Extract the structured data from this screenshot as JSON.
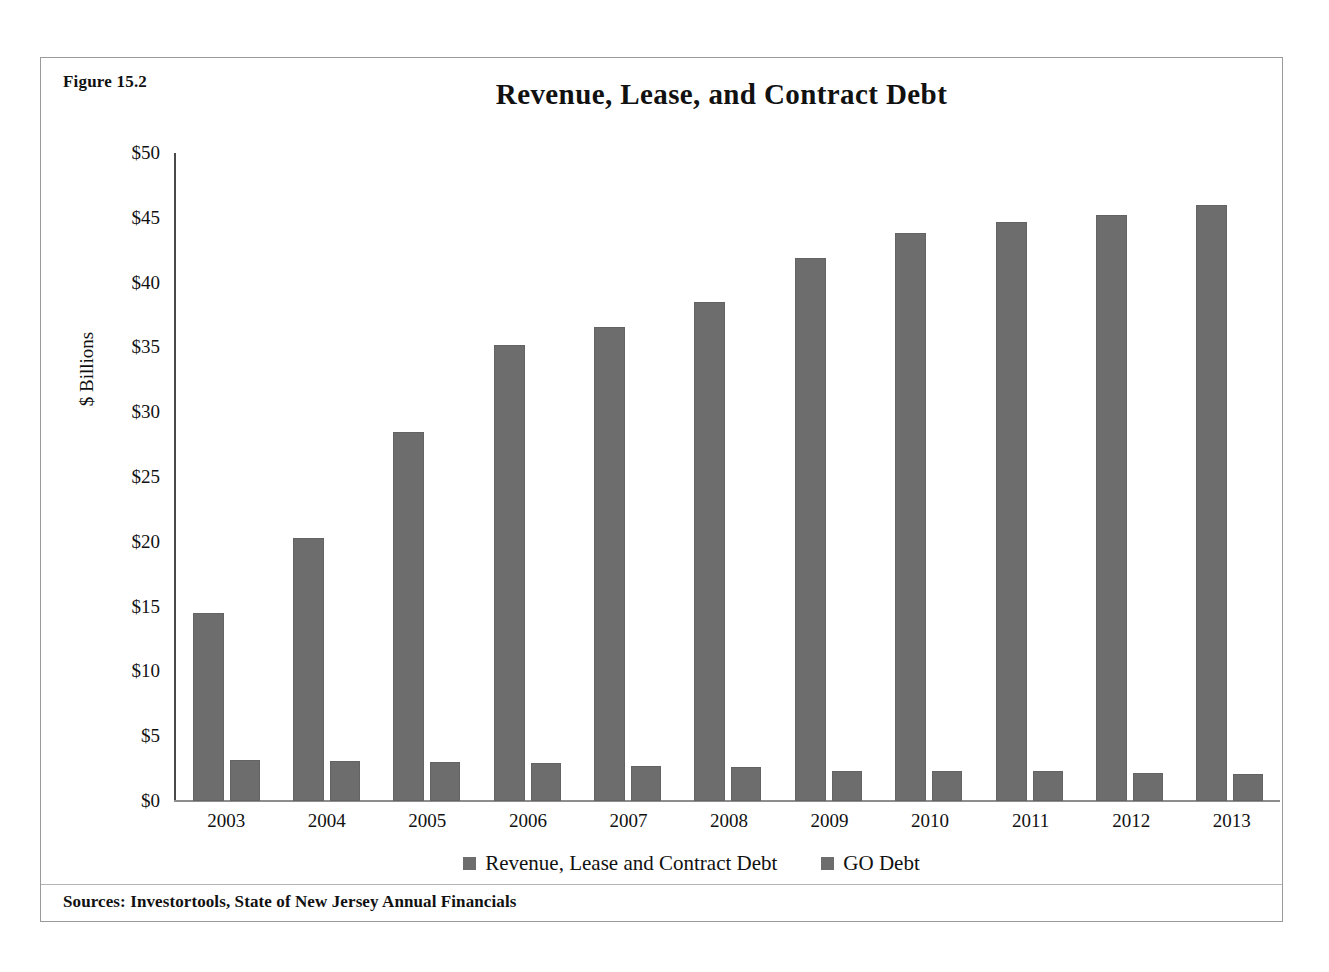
{
  "figure": {
    "number_label": "Figure 15.2",
    "source_note": "Sources: Investortools, State of New Jersey Annual Financials"
  },
  "chart_data": {
    "type": "bar",
    "title": "Revenue, Lease, and Contract Debt",
    "xlabel": "",
    "ylabel": "$ Billions",
    "ylim": [
      0,
      50
    ],
    "ytick_labels": [
      "$50",
      "$45",
      "$40",
      "$35",
      "$30",
      "$25",
      "$20",
      "$15",
      "$10",
      "$5",
      "$0"
    ],
    "ytick_values": [
      50,
      45,
      40,
      35,
      30,
      25,
      20,
      15,
      10,
      5,
      0
    ],
    "grid": false,
    "legend_position": "bottom",
    "categories": [
      "2003",
      "2004",
      "2005",
      "2006",
      "2007",
      "2008",
      "2009",
      "2010",
      "2011",
      "2012",
      "2013"
    ],
    "series": [
      {
        "name": "Revenue, Lease and Contract Debt",
        "color": "#6d6d6d",
        "values": [
          14.5,
          20.3,
          28.5,
          35.2,
          36.6,
          38.5,
          41.9,
          43.8,
          44.7,
          45.2,
          46.0
        ]
      },
      {
        "name": "GO Debt",
        "color": "#6d6d6d",
        "values": [
          3.2,
          3.1,
          3.0,
          2.9,
          2.7,
          2.6,
          2.3,
          2.3,
          2.3,
          2.2,
          2.1
        ]
      }
    ]
  },
  "colors": {
    "bar": "#6d6d6d",
    "frame_border": "#9a9a9a",
    "axis": "#4a4a4a",
    "text": "#111111"
  }
}
